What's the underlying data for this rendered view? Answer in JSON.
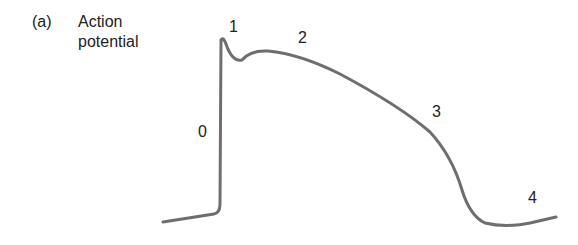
{
  "figure": {
    "panel_label": "(a)",
    "title_line1": "Action",
    "title_line2": "potential",
    "curve_color": "#6e6e6e",
    "text_color": "#222222"
  },
  "phases": [
    {
      "label": "0",
      "name": "rapid depolarization"
    },
    {
      "label": "1",
      "name": "early repolarization"
    },
    {
      "label": "2",
      "name": "plateau"
    },
    {
      "label": "3",
      "name": "rapid repolarization"
    },
    {
      "label": "4",
      "name": "resting potential"
    }
  ],
  "curve": {
    "points_px": [
      [
        163,
        222
      ],
      [
        215,
        213
      ],
      [
        220,
        205
      ],
      [
        221,
        40
      ],
      [
        225,
        45
      ],
      [
        240,
        62
      ],
      [
        262,
        52
      ],
      [
        300,
        60
      ],
      [
        380,
        100
      ],
      [
        430,
        130
      ],
      [
        450,
        160
      ],
      [
        465,
        200
      ],
      [
        485,
        222
      ],
      [
        515,
        226
      ],
      [
        556,
        217
      ]
    ]
  }
}
